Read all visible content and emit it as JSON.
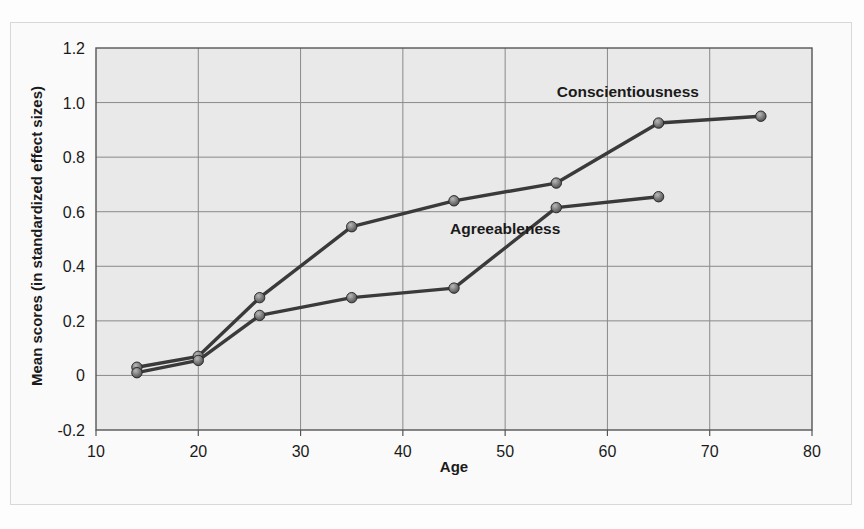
{
  "chart_data": {
    "type": "line",
    "title": "",
    "xlabel": "Age",
    "ylabel": "Mean scores (in standardized effect sizes)",
    "xlim": [
      10,
      80
    ],
    "ylim": [
      -0.2,
      1.2
    ],
    "xticks": [
      "10",
      "20",
      "30",
      "40",
      "50",
      "60",
      "70",
      "80"
    ],
    "xtick_values": [
      10,
      20,
      30,
      40,
      50,
      60,
      70,
      80
    ],
    "yticks": [
      "1.2",
      "1.0",
      "0.8",
      "0.6",
      "0.4",
      "0.2",
      "0",
      "-0.2"
    ],
    "ytick_values": [
      1.2,
      1.0,
      0.8,
      0.6,
      0.4,
      0.2,
      0,
      -0.2
    ],
    "grid": true,
    "legend_position": "inline-annotation",
    "series": [
      {
        "name": "Conscientiousness",
        "label_x": 62,
        "label_y": 1.02,
        "x": [
          14,
          20,
          26,
          35,
          45,
          55,
          65,
          75
        ],
        "values": [
          0.03,
          0.07,
          0.285,
          0.545,
          0.64,
          0.705,
          0.925,
          0.95
        ]
      },
      {
        "name": "Agreeableness",
        "label_x": 50,
        "label_y": 0.52,
        "x": [
          14,
          20,
          26,
          35,
          45,
          55,
          65
        ],
        "values": [
          0.01,
          0.055,
          0.22,
          0.285,
          0.32,
          0.615,
          0.655
        ]
      }
    ],
    "colors": {
      "line": "#3a3a3a",
      "marker_fill": "#6e6e6e",
      "marker_edge": "#2b2b2b",
      "plot_background": "#e9e9e9",
      "grid": "#8a8a8a",
      "frame": "#555555",
      "text": "#1a1a1a"
    }
  }
}
